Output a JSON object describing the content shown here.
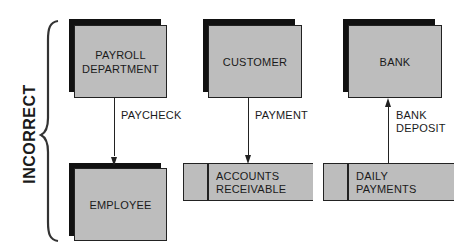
{
  "side_label": "INCORRECT",
  "colors": {
    "box_fill": "#bdbdbd",
    "shadow": "#111111",
    "line": "#222222"
  },
  "entities": [
    {
      "id": "payroll",
      "label_line1": "PAYROLL",
      "label_line2": "DEPARTMENT"
    },
    {
      "id": "employee",
      "label_line1": "EMPLOYEE"
    },
    {
      "id": "customer",
      "label_line1": "CUSTOMER"
    },
    {
      "id": "bank",
      "label_line1": "BANK"
    }
  ],
  "data_stores": [
    {
      "id": "accounts-receivable",
      "label_line1": "ACCOUNTS",
      "label_line2": "RECEIVABLE"
    },
    {
      "id": "daily-payments",
      "label_line1": "DAILY",
      "label_line2": "PAYMENTS"
    }
  ],
  "flows": [
    {
      "from": "PAYROLL DEPARTMENT",
      "to": "EMPLOYEE",
      "label_line1": "PAYCHECK",
      "direction": "down"
    },
    {
      "from": "CUSTOMER",
      "to": "ACCOUNTS RECEIVABLE",
      "label_line1": "PAYMENT",
      "direction": "down"
    },
    {
      "from": "DAILY PAYMENTS",
      "to": "BANK",
      "label_line1": "BANK",
      "label_line2": "DEPOSIT",
      "direction": "up"
    }
  ]
}
